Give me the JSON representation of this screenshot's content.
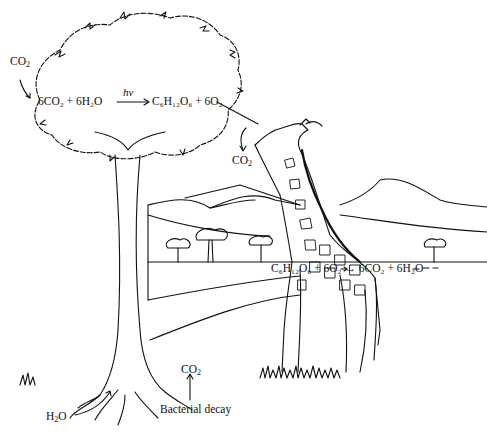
{
  "diagram": {
    "type": "illustration",
    "labels": {
      "co2_in_tree": {
        "base": "CO",
        "sub": "2"
      },
      "photosynthesis": {
        "left": "6CO₂ + 6H₂O",
        "arrow_label": "hν",
        "right": "C₆H₁₂O₆ + 6O₂"
      },
      "co2_leaf_out": {
        "base": "CO",
        "sub": "2"
      },
      "respiration": "C₆H₁₂O₆ + 6O₂ → 6CO₂ + 6H₂O",
      "co2_decay": {
        "base": "CO",
        "sub": "2"
      },
      "bacterial_decay": "Bacterial decay",
      "h2o_roots": {
        "base": "H",
        "sub": "2",
        "tail": "O"
      }
    },
    "elements": [
      "tree",
      "giraffe",
      "mountains",
      "acacia-trees",
      "grass",
      "roots"
    ],
    "colors": {
      "ink": "#111111",
      "background": "#ffffff"
    }
  }
}
